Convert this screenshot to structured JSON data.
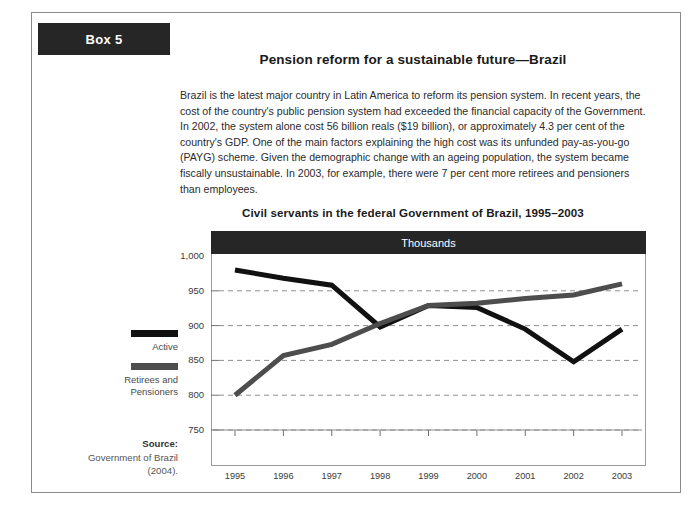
{
  "box": {
    "label": "Box 5"
  },
  "main": {
    "title": "Pension reform for a sustainable future—Brazil",
    "paragraph": "Brazil is the latest major country in Latin America to reform its pension system. In recent years, the cost of the country's public pension system had exceeded the financial capacity of the Government. In 2002, the system alone cost 56 billion reals ($19 billion), or approximately 4.3 per cent of the country's GDP. One of the main factors explaining the high cost was its unfunded pay-as-you-go (PAYG) scheme. Given the demographic change with an ageing population, the system became fiscally unsustainable. In 2003, for example, there were 7 per cent more retirees and pensioners than employees."
  },
  "legend": {
    "entries": [
      {
        "label": "Active",
        "color": "#111111"
      },
      {
        "label": "Retirees and Pensioners",
        "color": "#4d4d4d"
      }
    ]
  },
  "source": {
    "heading": "Source:",
    "lines": [
      "Government of Brazil",
      "(2004)."
    ]
  },
  "chart_data": {
    "type": "line",
    "title": "Civil servants in the federal Government of Brazil, 1995–2003",
    "banner": "Thousands",
    "xlabel": "",
    "ylabel": "Thousands",
    "categories": [
      "1995",
      "1996",
      "1997",
      "1998",
      "1999",
      "2000",
      "2001",
      "2002",
      "2003"
    ],
    "x": [
      1995,
      1996,
      1997,
      1998,
      1999,
      2000,
      2001,
      2002,
      2003
    ],
    "ylim": [
      750,
      1000
    ],
    "yticks": [
      750,
      800,
      850,
      900,
      950,
      1000
    ],
    "ytick_labels": [
      "750",
      "800",
      "850",
      "900",
      "950",
      "1,000"
    ],
    "grid": true,
    "legend_position": "left",
    "series": [
      {
        "name": "Active",
        "color": "#111111",
        "values": [
          980,
          968,
          958,
          898,
          929,
          926,
          895,
          848,
          895
        ]
      },
      {
        "name": "Retirees and Pensioners",
        "color": "#4d4d4d",
        "values": [
          800,
          857,
          873,
          903,
          929,
          932,
          939,
          944,
          960
        ]
      }
    ]
  }
}
